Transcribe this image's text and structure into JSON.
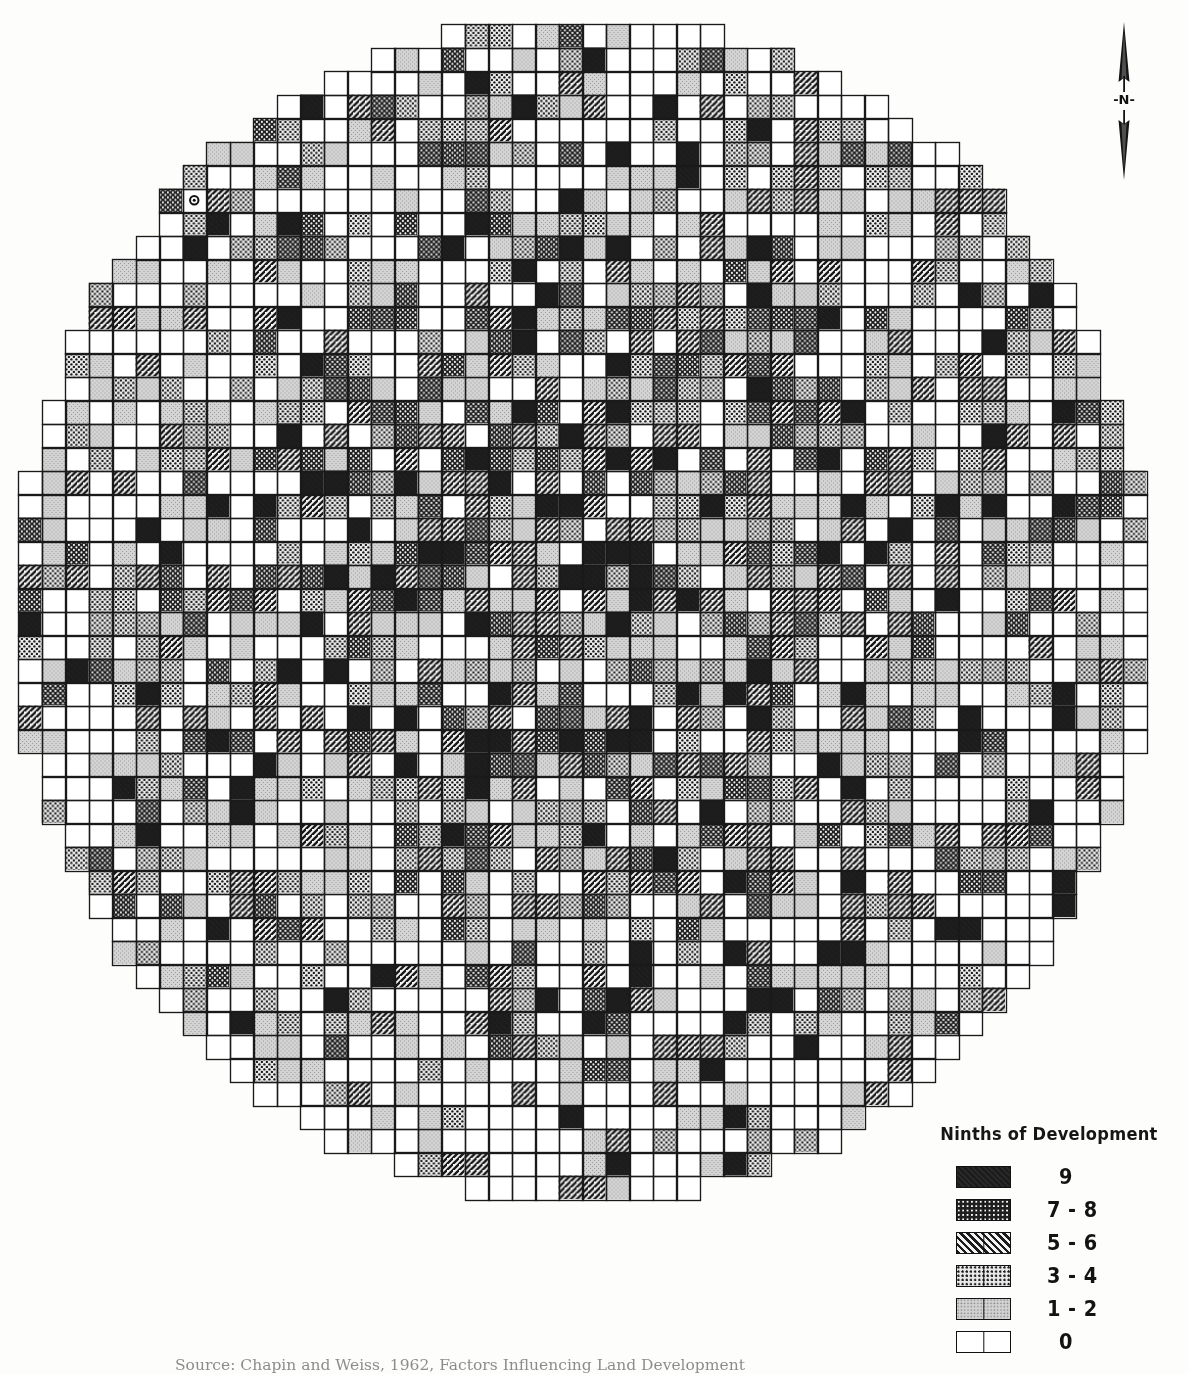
{
  "figure": {
    "kind": "grid-choropleth-map",
    "shape": "circular",
    "background_color": "#fdfdfc",
    "ink_color": "#111111"
  },
  "north_arrow": {
    "name": "north-arrow",
    "label": "-N-"
  },
  "legend": {
    "title": "Ninths of Development",
    "rows": [
      {
        "label": "9",
        "pattern": "solid-black",
        "class": "pat-9",
        "divider": false
      },
      {
        "label": "7 - 8",
        "pattern": "dense-dot-reverse",
        "class": "pat-78",
        "divider": true
      },
      {
        "label": "5 - 6",
        "pattern": "diagonal-hatch",
        "class": "pat-56",
        "divider": true
      },
      {
        "label": "3 - 4",
        "pattern": "medium-dot",
        "class": "pat-34",
        "divider": true
      },
      {
        "label": "1 - 2",
        "pattern": "light-stipple",
        "class": "pat-12",
        "divider": true
      },
      {
        "label": "0",
        "pattern": "white-empty",
        "class": "pat-0",
        "divider": true
      }
    ]
  },
  "source_caption": {
    "lead": "Source:",
    "text": "Source: Chapin and Weiss, 1962, Factors Influencing Land Development"
  },
  "chart_data": {
    "type": "heatmap",
    "title": "Ninths of Development",
    "xlabel": "",
    "ylabel": "",
    "grid": true,
    "legend_position": "bottom-right",
    "cell_px": 23.5,
    "grid_origin": {
      "x": 18,
      "y": 24
    },
    "grid_cols": 49,
    "grid_rows": 50,
    "mask": "ellipse",
    "mask_center_col": 24.0,
    "mask_center_row": 24.8,
    "mask_radius_cols": 24.2,
    "mask_radius_rows": 25.2,
    "classes": [
      {
        "value": 9,
        "label": "9",
        "fill": "#1b1b1b"
      },
      {
        "value": 7,
        "label": "7 - 8",
        "fill": "#1f1f1f"
      },
      {
        "value": 5,
        "label": "5 - 6",
        "fill": "#3a3a3a"
      },
      {
        "value": 3,
        "label": "3 - 4",
        "fill": "#9a9a9a"
      },
      {
        "value": 1,
        "label": "1 - 2",
        "fill": "#cfcfcf"
      },
      {
        "value": 0,
        "label": "0",
        "fill": "#ffffff"
      }
    ],
    "class_weight_center": [
      0.13,
      0.17,
      0.17,
      0.21,
      0.16,
      0.16
    ],
    "class_weight_edge": [
      0.02,
      0.03,
      0.04,
      0.13,
      0.18,
      0.6
    ],
    "hotspot_centers": [
      {
        "col": 21,
        "row": 27,
        "radius": 7,
        "intensity": 1.0
      },
      {
        "col": 30,
        "row": 12,
        "radius": 6,
        "intensity": 0.85
      },
      {
        "col": 24,
        "row": 20,
        "radius": 8,
        "intensity": 0.8
      },
      {
        "col": 14,
        "row": 22,
        "radius": 6,
        "intensity": 0.55
      },
      {
        "col": 33,
        "row": 24,
        "radius": 6,
        "intensity": 0.55
      },
      {
        "col": 20,
        "row": 5,
        "radius": 4,
        "intensity": 0.6
      }
    ],
    "point_marker": {
      "col": 7,
      "row": 7,
      "symbol": "circle",
      "note": "small open circle sample point"
    }
  }
}
